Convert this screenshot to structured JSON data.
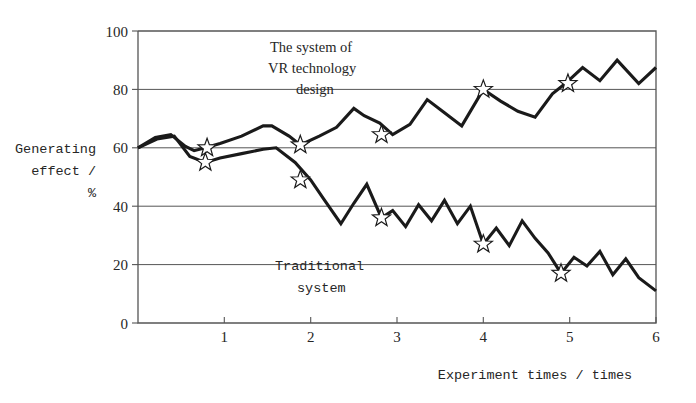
{
  "chart_data": {
    "type": "line",
    "title": "",
    "xlabel": "Experiment times / times",
    "ylabel": "Generating effect / %",
    "ylabel_lines": [
      "Generating",
      "effect /",
      "%"
    ],
    "xlim": [
      0,
      6
    ],
    "ylim": [
      0,
      100
    ],
    "grid": true,
    "gridlines_y": [
      20,
      40,
      60,
      80
    ],
    "legend_position": "inline-annotations",
    "xticks": [
      1,
      2,
      3,
      4,
      5,
      6
    ],
    "xtick_labels": [
      "1",
      "2",
      "3",
      "4",
      "5",
      "6"
    ],
    "yticks": [
      0,
      20,
      40,
      60,
      80,
      100
    ],
    "ytick_labels": [
      "0",
      "20",
      "40",
      "60",
      "80",
      "100"
    ],
    "annotations": [
      {
        "name": "vr-system-label",
        "lines": [
          "The system of",
          "VR technology",
          "design"
        ],
        "font": "serif"
      },
      {
        "name": "traditional-system-label",
        "lines": [
          "Traditional",
          "system"
        ],
        "font": "mono"
      }
    ],
    "series": [
      {
        "name": "The system of VR technology design",
        "marker": "star",
        "x": [
          0.0,
          0.2,
          0.38,
          0.55,
          0.65,
          0.78,
          0.95,
          1.2,
          1.45,
          1.55,
          1.75,
          1.88,
          2.1,
          2.3,
          2.5,
          2.62,
          2.8,
          2.95,
          3.15,
          3.35,
          3.55,
          3.75,
          4.0,
          4.2,
          4.4,
          4.6,
          4.8,
          4.95,
          5.15,
          5.35,
          5.55,
          5.8,
          6.0
        ],
        "y": [
          60.0,
          63.5,
          64.5,
          60.5,
          59.0,
          60.0,
          61.5,
          64.0,
          67.5,
          67.5,
          64.0,
          61.0,
          64.0,
          67.0,
          73.5,
          71.0,
          68.5,
          64.5,
          68.0,
          76.5,
          72.0,
          67.5,
          80.0,
          76.0,
          72.5,
          70.5,
          78.5,
          82.0,
          87.5,
          83.0,
          90.0,
          82.0,
          87.5
        ],
        "markers": [
          {
            "x": 0.8,
            "y": 60.0
          },
          {
            "x": 1.88,
            "y": 61.0
          },
          {
            "x": 2.82,
            "y": 64.5
          },
          {
            "x": 4.0,
            "y": 80.0
          },
          {
            "x": 4.98,
            "y": 82.0
          }
        ]
      },
      {
        "name": "Traditional system",
        "marker": "star",
        "x": [
          0.0,
          0.22,
          0.42,
          0.6,
          0.78,
          0.95,
          1.2,
          1.45,
          1.6,
          1.82,
          2.0,
          2.15,
          2.35,
          2.5,
          2.65,
          2.82,
          2.95,
          3.1,
          3.25,
          3.4,
          3.55,
          3.7,
          3.85,
          4.0,
          4.15,
          4.3,
          4.45,
          4.6,
          4.75,
          4.9,
          5.05,
          5.2,
          5.35,
          5.5,
          5.65,
          5.8,
          6.0
        ],
        "y": [
          60.0,
          63.0,
          64.0,
          57.0,
          55.0,
          56.5,
          58.0,
          59.5,
          60.0,
          55.0,
          49.0,
          42.5,
          34.0,
          41.0,
          47.5,
          36.0,
          38.5,
          33.0,
          40.5,
          35.0,
          42.0,
          34.0,
          40.0,
          27.0,
          32.5,
          26.5,
          35.0,
          29.0,
          24.0,
          17.0,
          22.5,
          19.5,
          24.5,
          16.5,
          22.0,
          15.5,
          11.0
        ],
        "markers": [
          {
            "x": 0.78,
            "y": 55.0
          },
          {
            "x": 1.88,
            "y": 49.0
          },
          {
            "x": 2.82,
            "y": 36.0
          },
          {
            "x": 4.0,
            "y": 27.0
          },
          {
            "x": 4.9,
            "y": 17.0
          }
        ]
      }
    ]
  },
  "plot_geometry": {
    "left": 138,
    "right": 656,
    "top": 31,
    "bottom": 323
  }
}
